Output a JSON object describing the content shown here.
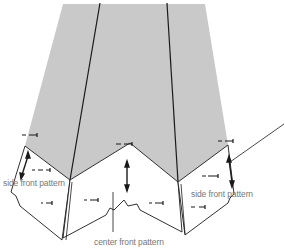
{
  "diagram": {
    "type": "sewing pattern layout",
    "colors": {
      "fabric": "#c9c9c9",
      "line": "#1a1a1a",
      "background": "#ffffff",
      "label": "#777777"
    },
    "labels": {
      "left_piece": "side front pattern",
      "right_piece": "side front pattern",
      "center_piece": "center front pattern"
    }
  }
}
